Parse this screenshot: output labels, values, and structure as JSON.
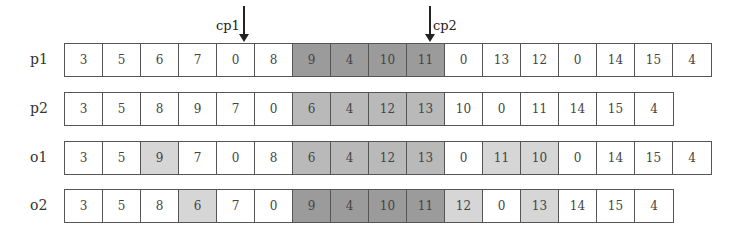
{
  "cut_points": [
    {
      "label": "cp1",
      "x": 243,
      "label_side": "left"
    },
    {
      "label": "cp2",
      "x": 429,
      "label_side": "right"
    }
  ],
  "shade_colors": {
    "none": "#ffffff",
    "light": "#d6d6d6",
    "mid": "#b9b9b9",
    "dark": "#9b9b9b"
  },
  "rows": [
    {
      "label": "p1",
      "top": 43,
      "values": [
        "3",
        "5",
        "6",
        "7",
        "0",
        "8",
        "9",
        "4",
        "10",
        "11",
        "0",
        "13",
        "12",
        "0",
        "14",
        "15",
        "4"
      ],
      "shades": [
        "none",
        "none",
        "none",
        "none",
        "none",
        "none",
        "dark",
        "dark",
        "dark",
        "dark",
        "none",
        "none",
        "none",
        "none",
        "none",
        "none",
        "none"
      ]
    },
    {
      "label": "p2",
      "top": 92,
      "values": [
        "3",
        "5",
        "8",
        "9",
        "7",
        "0",
        "6",
        "4",
        "12",
        "13",
        "10",
        "0",
        "11",
        "14",
        "15",
        "4"
      ],
      "shades": [
        "none",
        "none",
        "none",
        "none",
        "none",
        "none",
        "mid",
        "mid",
        "mid",
        "mid",
        "none",
        "none",
        "none",
        "none",
        "none",
        "none"
      ]
    },
    {
      "label": "o1",
      "top": 141,
      "values": [
        "3",
        "5",
        "9",
        "7",
        "0",
        "8",
        "6",
        "4",
        "12",
        "13",
        "0",
        "11",
        "10",
        "0",
        "14",
        "15",
        "4"
      ],
      "shades": [
        "none",
        "none",
        "light",
        "none",
        "none",
        "none",
        "mid",
        "mid",
        "mid",
        "mid",
        "none",
        "light",
        "light",
        "none",
        "none",
        "none",
        "none"
      ]
    },
    {
      "label": "o2",
      "top": 189,
      "values": [
        "3",
        "5",
        "8",
        "6",
        "7",
        "0",
        "9",
        "4",
        "10",
        "11",
        "12",
        "0",
        "13",
        "14",
        "15",
        "4"
      ],
      "shades": [
        "none",
        "none",
        "none",
        "light",
        "none",
        "none",
        "dark",
        "dark",
        "dark",
        "dark",
        "light",
        "none",
        "light",
        "none",
        "none",
        "none"
      ]
    }
  ]
}
